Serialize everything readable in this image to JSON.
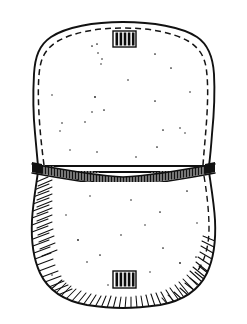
{
  "figure": {
    "title": "Two-part pouch line drawing",
    "subject": "pouch",
    "style": "ink line art",
    "background_color": "#ffffff",
    "ink_color": "#111111",
    "canvas": {
      "width": 247,
      "height": 324
    },
    "parts": [
      {
        "id": "upper-flap",
        "label": "Upper flap",
        "outline_stroke_width": 1.9,
        "has_inner_dashed_seam": true,
        "dash_pattern": "6 4",
        "bounds": {
          "x": 33,
          "y": 22,
          "width": 181,
          "height": 145
        }
      },
      {
        "id": "center-band",
        "label": "Woven center band",
        "fill_color": "#121212",
        "stitch_color": "#ffffff",
        "stitch_count": 74,
        "bounds": {
          "x": 32,
          "y": 163,
          "width": 183,
          "height": 16
        }
      },
      {
        "id": "lower-pouch",
        "label": "Lower pouch",
        "outline_stroke_width": 1.9,
        "has_hatching": true,
        "hatch_count": 96,
        "bounds": {
          "x": 30,
          "y": 172,
          "width": 187,
          "height": 135
        }
      }
    ],
    "clasps": [
      {
        "id": "top-clasp",
        "label": "Top striped clasp",
        "bar_count": 5,
        "x": 113,
        "y": 31,
        "width": 23,
        "height": 16
      },
      {
        "id": "bottom-clasp",
        "label": "Bottom striped clasp",
        "bar_count": 5,
        "x": 113,
        "y": 271,
        "width": 23,
        "height": 17
      }
    ],
    "speckles": {
      "label": "Stipple texture dots",
      "upper_count": 24,
      "lower_count": 17,
      "color": "#1a1a1a"
    }
  }
}
